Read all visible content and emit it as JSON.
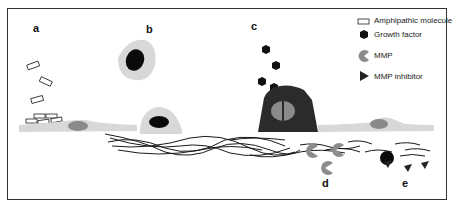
{
  "panels": {
    "a": "a",
    "b": "b",
    "c": "c",
    "d": "d",
    "e": "e"
  },
  "legend": {
    "items": [
      {
        "icon": "rectangle-outline-icon",
        "label": "Amphipathic molecule"
      },
      {
        "icon": "hexagon-icon",
        "label": "Growth factor"
      },
      {
        "icon": "pacman-icon",
        "label": "MMP"
      },
      {
        "icon": "triangle-icon",
        "label": "MMP inhibitor"
      }
    ]
  },
  "colors": {
    "cell_body": "#d8d8d8",
    "nucleus_gray": "#8a8a8a",
    "nucleus_dark": "#0a0a0a",
    "activated_cell": "#2b2b2b",
    "fiber": "#1a1a1a",
    "mmp": "#8c8c8c"
  }
}
